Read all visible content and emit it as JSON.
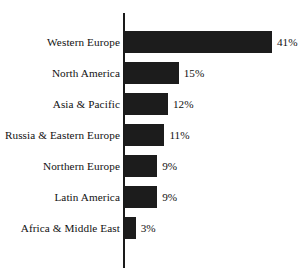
{
  "chart_data": {
    "type": "bar",
    "orientation": "horizontal",
    "title": "",
    "subtitle": "",
    "xlabel": "",
    "ylabel": "",
    "xlim": [
      0,
      41
    ],
    "grid": false,
    "legend": false,
    "bar_color": "#1c1c1c",
    "background_color": "#ffffff",
    "axis_color": "#1a1a1a",
    "value_suffix": "%",
    "categories": [
      "Western Europe",
      "North America",
      "Asia & Pacific",
      "Russia & Eastern Europe",
      "Northern Europe",
      "Latin America",
      "Africa & Middle East"
    ],
    "values": [
      41,
      15,
      12,
      11,
      9,
      9,
      3
    ],
    "value_labels": [
      "41%",
      "15%",
      "12%",
      "11%",
      "9%",
      "9%",
      "3%"
    ]
  },
  "rows": [
    {
      "label": "Western Europe",
      "value": 41,
      "value_label": "41%"
    },
    {
      "label": "North America",
      "value": 15,
      "value_label": "15%"
    },
    {
      "label": "Asia & Pacific",
      "value": 12,
      "value_label": "12%"
    },
    {
      "label": "Russia & Eastern Europe",
      "value": 11,
      "value_label": "11%"
    },
    {
      "label": "Northern Europe",
      "value": 9,
      "value_label": "9%"
    },
    {
      "label": "Latin America",
      "value": 9,
      "value_label": "9%"
    },
    {
      "label": "Africa & Middle East",
      "value": 3,
      "value_label": "3%"
    }
  ]
}
